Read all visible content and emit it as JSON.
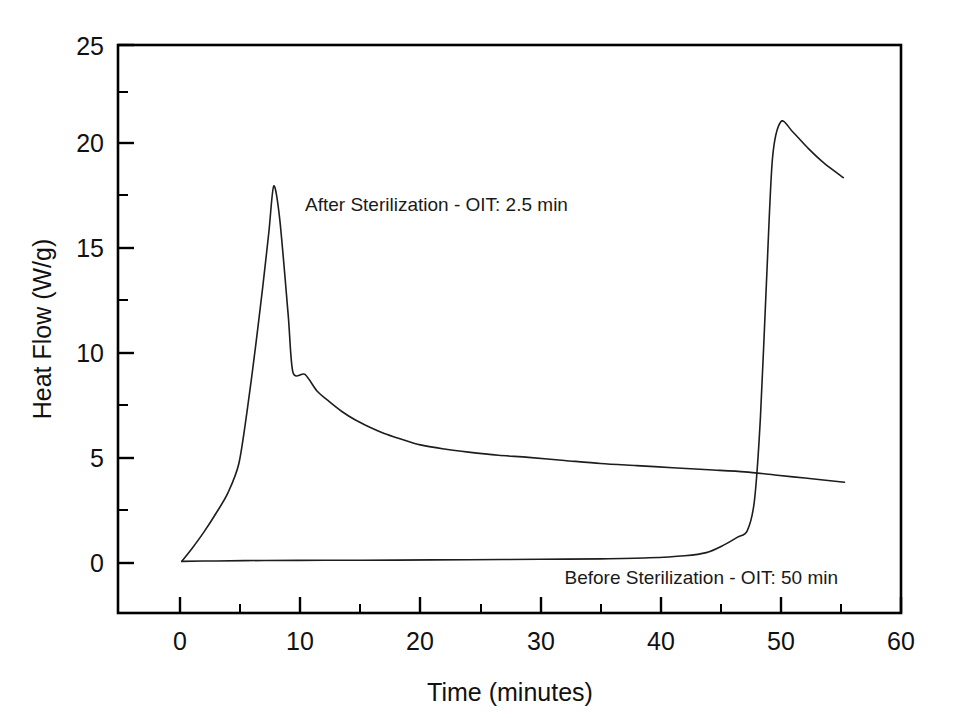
{
  "chart_data": {
    "type": "line",
    "title": "",
    "subtitle": "",
    "xlabel": "Time (minutes)",
    "ylabel": "Heat Flow (W/g)",
    "xlim": [
      -2.5,
      60
    ],
    "ylim": [
      -1.8,
      25
    ],
    "xticks": [
      0,
      10,
      20,
      30,
      40,
      50,
      60
    ],
    "xtick_labels": [
      "0",
      "10",
      "20",
      "30",
      "40",
      "50",
      "60"
    ],
    "xminor_ticks": [
      5,
      15,
      25,
      35,
      45,
      55
    ],
    "yticks": [
      0,
      5,
      10,
      15,
      20,
      25
    ],
    "ytick_labels": [
      "0",
      "5",
      "10",
      "15",
      "20",
      "25"
    ],
    "yminor_ticks": [
      2.5,
      7.5,
      12.5,
      17.5,
      22.5
    ],
    "grid": false,
    "legend": "none",
    "frame": "box",
    "annotations": [
      {
        "text": "After Sterilization - OIT: 2.5 min",
        "x": 10.4,
        "y": 17.0
      },
      {
        "text": "Before Sterilization - OIT: 50 min",
        "x": 32.0,
        "y": -1.0
      }
    ],
    "series": [
      {
        "name": "After Sterilization - OIT: 2.5 min",
        "color": "#1d1d1d",
        "x": [
          0.15,
          1.0,
          2.0,
          3.0,
          4.0,
          4.9,
          5.6,
          6.3,
          6.9,
          7.4,
          7.8,
          8.3,
          9.0,
          9.4,
          10.4,
          11.4,
          12.4,
          13.5,
          14.6,
          15.8,
          17.0,
          18.3,
          20.0,
          22.0,
          24.0,
          26.5,
          29.0,
          32.0,
          35.0,
          38.0,
          41.0,
          44.0,
          47.0,
          49.5,
          52.0,
          55.3
        ],
        "y": [
          0.08,
          0.7,
          1.5,
          2.4,
          3.4,
          4.8,
          7.4,
          10.5,
          13.4,
          16.0,
          18.2,
          16.6,
          12.0,
          9.2,
          9.1,
          8.3,
          7.8,
          7.3,
          6.9,
          6.55,
          6.25,
          6.0,
          5.7,
          5.5,
          5.35,
          5.2,
          5.1,
          4.95,
          4.8,
          4.7,
          4.6,
          4.5,
          4.4,
          4.25,
          4.1,
          3.9
        ]
      },
      {
        "name": "Before Sterilization - OIT: 50 min",
        "color": "#1d1d1d",
        "x": [
          0.15,
          3.0,
          7.0,
          12.0,
          18.0,
          24.0,
          30.0,
          35.0,
          39.0,
          42.0,
          43.8,
          45.2,
          46.4,
          47.2,
          47.8,
          48.3,
          48.8,
          49.3,
          50.0,
          51.0,
          52.3,
          53.6,
          55.2
        ],
        "y": [
          0.08,
          0.1,
          0.12,
          0.13,
          0.14,
          0.16,
          0.18,
          0.2,
          0.25,
          0.35,
          0.5,
          0.85,
          1.25,
          1.55,
          3.0,
          7.0,
          13.5,
          19.5,
          21.3,
          20.8,
          20.0,
          19.3,
          18.6
        ]
      }
    ]
  },
  "axes": {
    "y_title": "Heat Flow (W/g)",
    "x_title": "Time (minutes)"
  },
  "annotations": {
    "after": "After Sterilization - OIT: 2.5 min",
    "before": "Before Sterilization - OIT: 50 min"
  },
  "xtick_labels": {
    "t0": "0",
    "t1": "10",
    "t2": "20",
    "t3": "30",
    "t4": "40",
    "t5": "50",
    "t6": "60"
  },
  "ytick_labels": {
    "v0": "0",
    "v1": "5",
    "v2": "10",
    "v3": "15",
    "v4": "20",
    "v5": "25"
  }
}
